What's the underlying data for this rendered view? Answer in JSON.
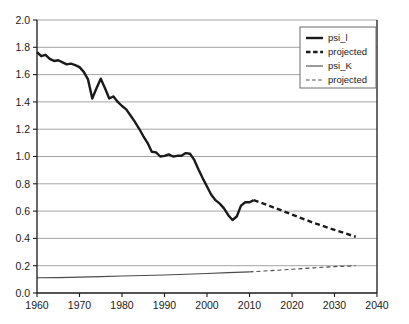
{
  "chart_data": {
    "type": "line",
    "title": "",
    "subtitle": "",
    "xlabel": "",
    "ylabel": "",
    "xlim": [
      1960,
      2040
    ],
    "ylim": [
      0.0,
      2.0
    ],
    "grid": "horizontal",
    "legend_position": "top-right",
    "x_tick_labels": [
      "1960",
      "1970",
      "1980",
      "1990",
      "2000",
      "2010",
      "2020",
      "2030",
      "2040"
    ],
    "x_ticks": [
      1960,
      1970,
      1980,
      1990,
      2000,
      2010,
      2020,
      2030,
      2040
    ],
    "y_tick_labels": [
      "0.0",
      "0.2",
      "0.4",
      "0.6",
      "0.8",
      "1.0",
      "1.2",
      "1.4",
      "1.6",
      "1.8",
      "2.0"
    ],
    "y_ticks": [
      0.0,
      0.2,
      0.4,
      0.6,
      0.8,
      1.0,
      1.2,
      1.4,
      1.6,
      1.8,
      2.0
    ],
    "series": [
      {
        "name": "psi_l",
        "style": "solid",
        "width": 2.4,
        "color": "#1a1a1a",
        "x": [
          1960,
          1961,
          1962,
          1963,
          1964,
          1965,
          1966,
          1967,
          1968,
          1969,
          1970,
          1971,
          1972,
          1973,
          1974,
          1975,
          1976,
          1977,
          1978,
          1979,
          1980,
          1981,
          1982,
          1983,
          1984,
          1985,
          1986,
          1987,
          1988,
          1989,
          1990,
          1991,
          1992,
          1993,
          1994,
          1995,
          1996,
          1997,
          1998,
          1999,
          2000,
          2001,
          2002,
          2003,
          2004,
          2005,
          2006,
          2007,
          2008,
          2009,
          2010,
          2011
        ],
        "values": [
          1.765,
          1.735,
          1.745,
          1.715,
          1.7,
          1.705,
          1.69,
          1.675,
          1.68,
          1.67,
          1.655,
          1.62,
          1.565,
          1.425,
          1.5,
          1.57,
          1.5,
          1.425,
          1.44,
          1.4,
          1.37,
          1.345,
          1.3,
          1.255,
          1.205,
          1.15,
          1.1,
          1.035,
          1.03,
          1.0,
          1.005,
          1.015,
          1.0,
          1.005,
          1.005,
          1.025,
          1.02,
          0.975,
          0.905,
          0.84,
          0.78,
          0.72,
          0.68,
          0.655,
          0.62,
          0.57,
          0.535,
          0.56,
          0.64,
          0.665,
          0.665,
          0.68
        ]
      },
      {
        "name": "projected",
        "style": "dashed",
        "width": 2.4,
        "color": "#1a1a1a",
        "x": [
          2011,
          2015,
          2020,
          2025,
          2030,
          2035
        ],
        "values": [
          0.68,
          0.635,
          0.575,
          0.515,
          0.462,
          0.412
        ]
      },
      {
        "name": "psi_K",
        "style": "solid",
        "width": 1.1,
        "color": "#4a4a4a",
        "x": [
          1960,
          1965,
          1970,
          1975,
          1980,
          1985,
          1990,
          1995,
          2000,
          2005,
          2010
        ],
        "values": [
          0.112,
          0.113,
          0.116,
          0.12,
          0.124,
          0.128,
          0.132,
          0.137,
          0.143,
          0.149,
          0.155
        ]
      },
      {
        "name": "projected",
        "style": "dashed",
        "width": 1.1,
        "color": "#4a4a4a",
        "x": [
          2010,
          2015,
          2020,
          2025,
          2030,
          2035
        ],
        "values": [
          0.155,
          0.164,
          0.174,
          0.184,
          0.193,
          0.2
        ]
      }
    ]
  },
  "legend": {
    "entries": [
      {
        "label": "psi_l",
        "style": "solid",
        "weight": "thick"
      },
      {
        "label": "projected",
        "style": "dashed",
        "weight": "thick"
      },
      {
        "label": "psi_K",
        "style": "solid",
        "weight": "thin"
      },
      {
        "label": "projected",
        "style": "dashed",
        "weight": "thin"
      }
    ]
  },
  "colors": {
    "axis": "#1a1a1a",
    "grid": "#9a9a9a",
    "plot_background": "#ffffff",
    "series_primary": "#1a1a1a",
    "series_secondary": "#4a4a4a"
  }
}
